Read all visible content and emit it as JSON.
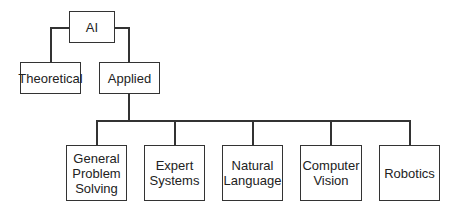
{
  "diagram": {
    "type": "tree",
    "root": {
      "label": "AI"
    },
    "level1": [
      {
        "label": "Theoretical"
      },
      {
        "label": "Applied"
      }
    ],
    "level2": [
      {
        "label": "General\nProblem\nSolving"
      },
      {
        "label": "Expert\nSystems"
      },
      {
        "label": "Natural\nLanguage"
      },
      {
        "label": "Computer\nVision"
      },
      {
        "label": "Robotics"
      }
    ],
    "colors": {
      "line": "#333333",
      "text": "#222222",
      "background": "#ffffff"
    }
  }
}
